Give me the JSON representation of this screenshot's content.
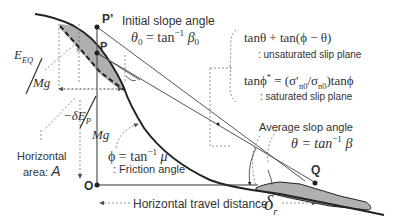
{
  "diagram": {
    "colors": {
      "line": "#222222",
      "thin_line": "#555555",
      "dashed": "#777777",
      "mass_fill": "#b0b0b0",
      "text": "#333333",
      "background": "#ffffff"
    },
    "points": {
      "p_prime": "P’",
      "p": "P",
      "o": "O",
      "q": "Q"
    },
    "labels": {
      "initial_slope_title": "Initial slope angle",
      "initial_slope_eq_lhs": "θ",
      "initial_slope_eq_sub": "0",
      "initial_slope_eq_mid": " = tan",
      "initial_slope_eq_sup": "−1",
      "initial_slope_eq_rhs": "β",
      "initial_slope_eq_rhs_sub": "0",
      "eeq_num": "E",
      "eeq_sub": "EQ",
      "eeq_den": "Mg",
      "dep_num": "−δE",
      "dep_sub": "P",
      "dep_den": "Mg",
      "horizontal_area_line1": "Horizontal",
      "horizontal_area_line2": "area: ",
      "horizontal_area_symbol": "A",
      "friction_eq_lhs": "ϕ = tan",
      "friction_eq_sup": "−1",
      "friction_eq_rhs": "μ",
      "friction_label": ": Friction angle",
      "unsat_eq": "tanθ + tan(ϕ − θ)",
      "unsat_label": ": unsaturated slip plane",
      "sat_eq_lhs": "tanϕ",
      "sat_eq_sup": "*",
      "sat_eq_rhs": " = (σ′",
      "sat_eq_sub1": "n0",
      "sat_eq_mid": "/σ",
      "sat_eq_sub2": "n0",
      "sat_eq_end": ")tanϕ",
      "sat_label": ": saturated slip plane",
      "avg_slope_title": "Average slop angle",
      "avg_slope_eq_lhs": "θ = tan",
      "avg_slope_eq_sup": "−1",
      "avg_slope_eq_rhs": "β",
      "travel_label": "Horizontal travel distance",
      "travel_symbol": "δ",
      "travel_sub": "r",
      "x_marker": "x"
    }
  }
}
